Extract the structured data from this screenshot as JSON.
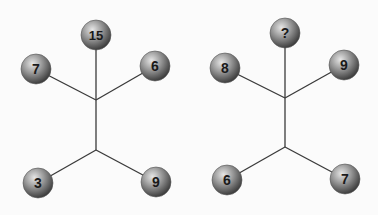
{
  "puzzle": {
    "diagrams": [
      {
        "id": "left",
        "junction_top": [
          96,
          100
        ],
        "junction_bottom": [
          96,
          150
        ],
        "balls": [
          {
            "position": "top",
            "label": "15",
            "x": 96,
            "y": 35
          },
          {
            "position": "upper-left",
            "label": "7",
            "x": 36,
            "y": 69
          },
          {
            "position": "upper-right",
            "label": "6",
            "x": 155,
            "y": 66
          },
          {
            "position": "lower-left",
            "label": "3",
            "x": 38,
            "y": 183
          },
          {
            "position": "lower-right",
            "label": "9",
            "x": 156,
            "y": 182
          }
        ]
      },
      {
        "id": "right",
        "junction_top": [
          285,
          98
        ],
        "junction_bottom": [
          285,
          147
        ],
        "balls": [
          {
            "position": "top",
            "label": "?",
            "x": 285,
            "y": 33
          },
          {
            "position": "upper-left",
            "label": "8",
            "x": 225,
            "y": 68
          },
          {
            "position": "upper-right",
            "label": "9",
            "x": 344,
            "y": 65
          },
          {
            "position": "lower-left",
            "label": "6",
            "x": 227,
            "y": 180
          },
          {
            "position": "lower-right",
            "label": "7",
            "x": 345,
            "y": 179
          }
        ]
      }
    ],
    "colors": {
      "background": "#fbfbfb",
      "line": "#3a3a3a",
      "ball_light": "#d8d8d8",
      "ball_mid": "#8a8a8a",
      "ball_dark": "#3c3c3c",
      "label": "#1a1a1a"
    }
  }
}
